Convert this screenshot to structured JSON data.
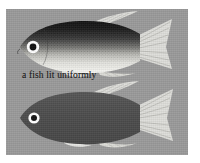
{
  "figure": {
    "plate_color": "#9a9a9a",
    "border_color": "#ffffff",
    "ink_color": "#1d1d1d"
  },
  "panels": [
    {
      "id": "top",
      "caption": "a fish lit uniformly",
      "fish": {
        "name": "uniformly-lit-fish",
        "back_color": "#1c1c1c",
        "belly_color": "#f2f2ee",
        "mid_color": "#8d8d8d",
        "fin_color": "#e8e8e4",
        "eye_ring_color": "#ffffff",
        "pupil_color": "#101010",
        "shading": "graded dark speckled dorsal to white ventral"
      }
    },
    {
      "id": "bottom",
      "caption": "lit from above",
      "fish": {
        "name": "lit-from-above-fish",
        "back_color": "#4e4e4e",
        "belly_color": "#4e4e4e",
        "mid_color": "#565656",
        "fin_color": "#e4e4e0",
        "eye_ring_color": "#ffffff",
        "pupil_color": "#101010",
        "shading": "uniform dark silhouette"
      }
    }
  ]
}
